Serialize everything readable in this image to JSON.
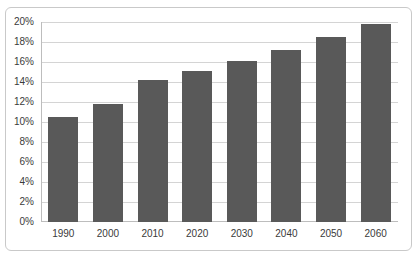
{
  "chart_data": {
    "type": "bar",
    "title": "",
    "subtitle": "",
    "xlabel": "",
    "ylabel": "",
    "categories": [
      "1990",
      "2000",
      "2010",
      "2020",
      "2030",
      "2040",
      "2050",
      "2060"
    ],
    "values": [
      10.5,
      11.8,
      14.2,
      15.1,
      16.1,
      17.2,
      18.5,
      19.8
    ],
    "value_suffix": "%",
    "ylim": [
      0,
      20
    ],
    "ytick_step": 2,
    "ytick_labels": [
      "0%",
      "2%",
      "4%",
      "6%",
      "8%",
      "10%",
      "12%",
      "14%",
      "16%",
      "18%",
      "20%"
    ],
    "ytick_values": [
      0,
      2,
      4,
      6,
      8,
      10,
      12,
      14,
      16,
      18,
      20
    ],
    "grid": true,
    "legend": false,
    "legend_position": "none",
    "bar_color": "#595959",
    "grid_color": "#d4d4d4",
    "axis_color": "#bdbdbd",
    "text_color": "#3a3a3a",
    "background_color": "#ffffff",
    "border_color": "#c9c9c9"
  }
}
